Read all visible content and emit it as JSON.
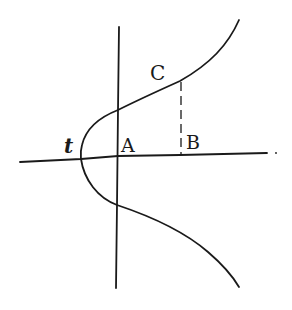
{
  "diagram": {
    "labels": {
      "c": "C",
      "a": "A",
      "b": "B",
      "t": "t"
    },
    "stroke_color": "#1a1a1a",
    "background": "#ffffff"
  }
}
